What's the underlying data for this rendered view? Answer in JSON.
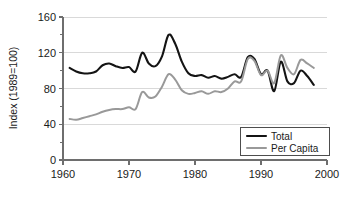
{
  "chart_data": {
    "type": "line",
    "title": "",
    "subtitle": "",
    "xlabel": "",
    "ylabel": "Index (1989=100)",
    "xlim": [
      1960,
      2000
    ],
    "ylim": [
      0,
      160
    ],
    "xticks": [
      1960,
      1970,
      1980,
      1990,
      2000
    ],
    "xtick_labels": [
      "1960",
      "1970",
      "1980",
      "1990",
      "2000"
    ],
    "yticks": [
      0,
      40,
      80,
      120,
      160
    ],
    "ytick_labels": [
      "0",
      "40",
      "80",
      "120",
      "160"
    ],
    "y_minor_ticks": [
      20,
      60,
      100,
      140
    ],
    "grid": "horizontal",
    "grid_color": "#d9d9d9",
    "legend_position": "bottom-right",
    "x": [
      1961,
      1962,
      1963,
      1964,
      1965,
      1966,
      1967,
      1968,
      1969,
      1970,
      1971,
      1972,
      1973,
      1974,
      1975,
      1976,
      1977,
      1978,
      1979,
      1980,
      1981,
      1982,
      1983,
      1984,
      1985,
      1986,
      1987,
      1988,
      1989,
      1990,
      1991,
      1992,
      1993,
      1994,
      1995,
      1996,
      1997,
      1998
    ],
    "series": [
      {
        "name": "Total",
        "color": "#141414",
        "width": 2.1,
        "values": [
          103,
          99,
          97,
          97,
          99,
          106,
          108,
          105,
          103,
          104,
          99,
          120,
          108,
          105,
          116,
          140,
          130,
          110,
          97,
          94,
          95,
          92,
          94,
          91,
          93,
          96,
          93,
          115,
          113,
          96,
          100,
          77,
          110,
          88,
          86,
          100,
          94,
          84
        ]
      },
      {
        "name": "Per Capita",
        "color": "#999999",
        "width": 2.0,
        "values": [
          46,
          45,
          47,
          49,
          51,
          54,
          56,
          57,
          57,
          59,
          57,
          76,
          70,
          71,
          82,
          96,
          90,
          78,
          74,
          75,
          77,
          74,
          77,
          76,
          80,
          88,
          88,
          113,
          111,
          95,
          100,
          86,
          117,
          103,
          96,
          112,
          108,
          103
        ]
      }
    ]
  },
  "legend": {
    "items": [
      {
        "label": "Total",
        "color": "#141414"
      },
      {
        "label": "Per Capita",
        "color": "#999999"
      }
    ]
  },
  "axes": {
    "y_axis_title": "Index (1989=100)"
  }
}
